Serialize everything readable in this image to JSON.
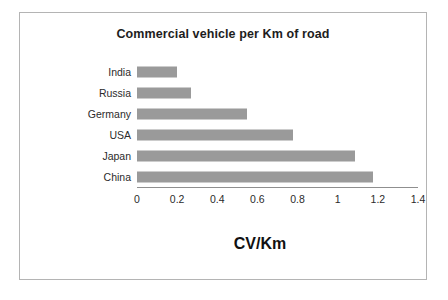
{
  "figure": {
    "frame_color": "#b4b4b4",
    "background": "#ffffff"
  },
  "chart_data": {
    "type": "bar",
    "orientation": "horizontal",
    "title": "Commercial vehicle per Km of road",
    "xlabel": "CV/Km",
    "ylabel": "Country",
    "categories": [
      "India",
      "Russia",
      "Germany",
      "USA",
      "Japan",
      "China"
    ],
    "values": [
      0.2,
      0.27,
      0.55,
      0.78,
      1.09,
      1.18
    ],
    "xlim": [
      0,
      1.4
    ],
    "xticks": [
      0,
      0.2,
      0.4,
      0.6,
      0.8,
      1,
      1.2,
      1.4
    ],
    "xtick_labels": [
      "0",
      "0.2",
      "0.4",
      "0.6",
      "0.8",
      "1",
      "1.2",
      "1.4"
    ],
    "grid": false,
    "legend": false,
    "bar_color": "#9a9a9a",
    "series": [
      {
        "name": "CV/Km",
        "values": [
          0.2,
          0.27,
          0.55,
          0.78,
          1.09,
          1.18
        ]
      }
    ]
  }
}
